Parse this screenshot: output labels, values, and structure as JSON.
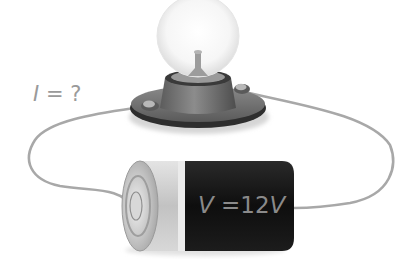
{
  "diagram": {
    "type": "electric-circuit",
    "components": [
      {
        "name": "light-bulb",
        "description": "incandescent bulb on round base"
      },
      {
        "name": "battery",
        "description": "cylindrical battery"
      },
      {
        "name": "wire-left",
        "description": "wire connecting bulb base left terminal to battery positive terminal"
      },
      {
        "name": "wire-right",
        "description": "wire connecting bulb base right terminal to battery negative end"
      }
    ],
    "labels": {
      "current": {
        "variable": "I",
        "equals": "=",
        "value": "?"
      },
      "voltage": {
        "variable": "V",
        "equals": "=",
        "value": "12",
        "unit": "V"
      }
    },
    "colors": {
      "background": "#ffffff",
      "wire": "#a8a8a8",
      "label_text": "#9a9a9a",
      "battery_body": "#141414",
      "battery_cap": "#cfcfcf",
      "bulb_base": "#6e6e6e",
      "bulb_glass": "#f4f4f4"
    }
  }
}
